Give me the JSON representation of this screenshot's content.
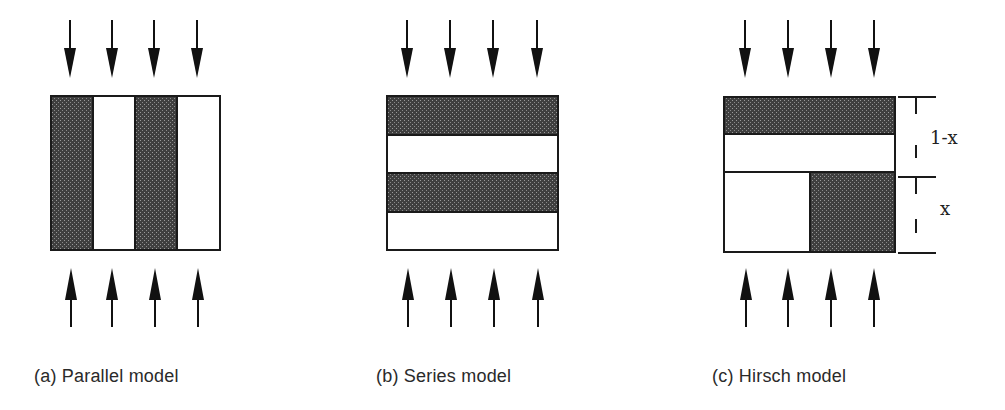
{
  "figure": {
    "panels": [
      {
        "id": "a",
        "caption": "(a)  Parallel model",
        "layout": "vertical-stripes",
        "stripes": [
          "shaded",
          "white",
          "shaded",
          "white"
        ]
      },
      {
        "id": "b",
        "caption": "(b) Series model",
        "layout": "horizontal-stripes",
        "stripes": [
          "shaded",
          "white",
          "shaded",
          "white"
        ]
      },
      {
        "id": "c",
        "caption": "(c) Hirsch model",
        "layout": "combined",
        "top_part": [
          "shaded",
          "white"
        ],
        "bottom_part": [
          "white",
          "shaded"
        ],
        "dimensions": [
          {
            "label": "1-x"
          },
          {
            "label": "x"
          }
        ]
      }
    ],
    "arrows_per_side": 4,
    "colors": {
      "shaded": "#5a5a5a",
      "outline": "#1a1a1a",
      "background": "#ffffff"
    }
  }
}
